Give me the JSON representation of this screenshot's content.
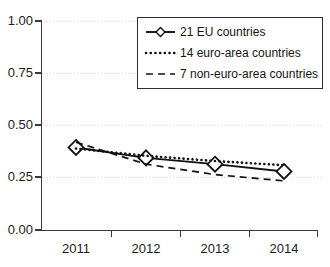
{
  "chart_data": {
    "type": "line",
    "title": "",
    "xlabel": "",
    "ylabel": "",
    "x": [
      "2011",
      "2012",
      "2013",
      "2014"
    ],
    "categories": [
      "2011",
      "2012",
      "2013",
      "2014"
    ],
    "series": [
      {
        "name": "21 EU countries",
        "style": "solid",
        "marker": "open-diamond",
        "values": [
          0.395,
          0.345,
          0.315,
          0.28
        ]
      },
      {
        "name": "14 euro-area countries",
        "style": "dotted",
        "marker": "none",
        "values": [
          0.39,
          0.355,
          0.33,
          0.31
        ]
      },
      {
        "name": "7 non-euro-area countries",
        "style": "dashed",
        "marker": "none",
        "values": [
          0.42,
          0.315,
          0.265,
          0.235
        ]
      }
    ],
    "ylim": [
      0.0,
      1.0
    ],
    "yticks": [
      0.0,
      0.25,
      0.5,
      0.75,
      1.0
    ],
    "ytick_labels": [
      "0.00",
      "0.25",
      "0.50",
      "0.75",
      "1.00"
    ],
    "xtick_labels": [
      "2011",
      "2012",
      "2013",
      "2014"
    ],
    "grid": "horizontal-dotted",
    "legend_position": "top-right",
    "colors": {
      "line": "#111111",
      "grid": "#d9d9d9",
      "axis": "#3a3a3a",
      "background": "#ffffff",
      "text": "#1c1c1c"
    }
  },
  "axis": {
    "y_labels": [
      "1.00",
      "0.75",
      "0.50",
      "0.25",
      "0.00"
    ],
    "x_labels": [
      "2011",
      "2012",
      "2013",
      "2014"
    ]
  },
  "legend": {
    "entries": [
      {
        "label": "21 EU countries",
        "icon": "solid-line-diamond-marker"
      },
      {
        "label": "14 euro-area countries",
        "icon": "dotted-line"
      },
      {
        "label": "7 non-euro-area countries",
        "icon": "dashed-line"
      }
    ]
  }
}
